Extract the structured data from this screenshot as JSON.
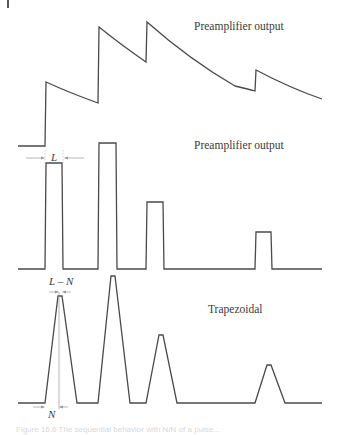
{
  "labels": {
    "top_panel": "Preamplifier output",
    "middle_panel": "Preamplifier output",
    "bottom_panel": "Trapezoidal",
    "L": "L",
    "L_minus_N": "L – N",
    "N": "N",
    "caption": "Figure 16.6  The sequential behavior with N/N of a pulse..."
  },
  "colors": {
    "stroke": "#4a4a4a",
    "annotation": "#9a9a9a"
  },
  "pulses": {
    "times": [
      0.0,
      0.345,
      0.63,
      1.0
    ],
    "relative_amplitudes": [
      0.6,
      1.0,
      0.55,
      0.25
    ]
  }
}
